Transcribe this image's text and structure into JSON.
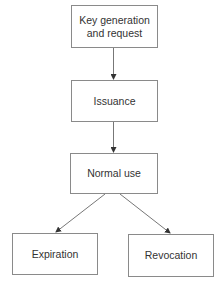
{
  "diagram": {
    "type": "flowchart",
    "title": "",
    "colors": {
      "border": "#8a8a8a",
      "arrow": "#555555",
      "text": "#333333",
      "background": "#ffffff"
    },
    "nodes": [
      {
        "id": "n1",
        "label": "Key generation\nand request"
      },
      {
        "id": "n2",
        "label": "Issuance"
      },
      {
        "id": "n3",
        "label": "Normal use"
      },
      {
        "id": "n4",
        "label": "Expiration"
      },
      {
        "id": "n5",
        "label": "Revocation"
      }
    ],
    "edges": [
      {
        "from": "n1",
        "to": "n2"
      },
      {
        "from": "n2",
        "to": "n3"
      },
      {
        "from": "n3",
        "to": "n4"
      },
      {
        "from": "n3",
        "to": "n5"
      }
    ]
  }
}
